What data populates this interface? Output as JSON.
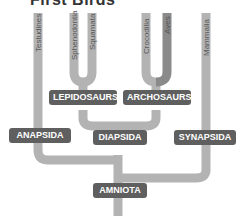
{
  "title": "First Birds",
  "colors": {
    "branch": "#b3b3b3",
    "aves_branch": "#8a8a8a",
    "node_label_bg": "#5f5f5f"
  },
  "leaves": [
    "Testudines",
    "Sphenodontia",
    "Squamata",
    "Crocodilia",
    "Aves",
    "Mammalia"
  ],
  "nodes": {
    "lepidosaurs": "LEPIDOSAURS",
    "archosaurs": "ARCHOSAURS",
    "anapsida": "ANAPSIDA",
    "diapsida": "DIAPSIDA",
    "synapsida": "SYNAPSIDA",
    "amniota": "AMNIOTA"
  }
}
